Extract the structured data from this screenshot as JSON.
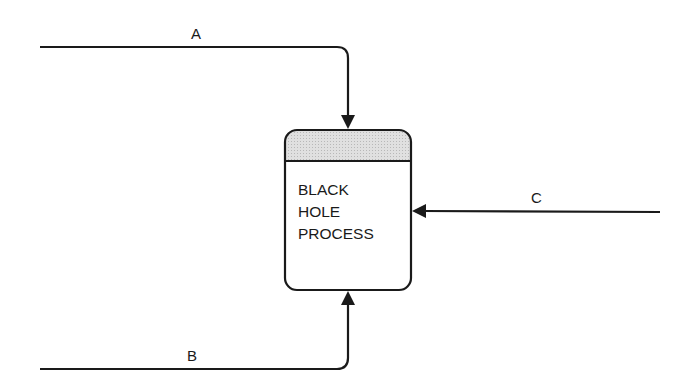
{
  "diagram": {
    "process": {
      "lines": [
        "BLACK",
        "HOLE",
        "PROCESS"
      ],
      "header_fill": "#d9d9d9"
    },
    "flows": [
      {
        "label": "A",
        "direction": "into process from top"
      },
      {
        "label": "B",
        "direction": "into process from bottom"
      },
      {
        "label": "C",
        "direction": "into process from right"
      }
    ]
  }
}
